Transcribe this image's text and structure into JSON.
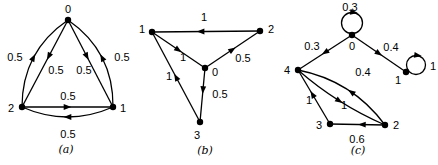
{
  "figure": {
    "background_color": "#ffffff",
    "ink_color": "#000000",
    "graphs": [
      {
        "id": "a",
        "caption": "(a)",
        "caption_pos": {
          "x": 66,
          "y": 149
        },
        "nodes": [
          {
            "id": "0",
            "x": 68,
            "y": 20,
            "lx": 68,
            "ly": 9
          },
          {
            "id": "2",
            "x": 22,
            "y": 107,
            "lx": 11,
            "ly": 108
          },
          {
            "id": "1",
            "x": 113,
            "y": 107,
            "lx": 123,
            "ly": 108
          }
        ],
        "edges": [
          {
            "from": "2",
            "to": "0",
            "weight": "0.5",
            "bend": -26,
            "t": 0.5,
            "label": {
              "x": 15,
              "y": 57
            }
          },
          {
            "from": "0",
            "to": "2",
            "weight": "0.5",
            "bend": 0,
            "t": 0.42,
            "label": {
              "x": 56,
              "y": 70
            }
          },
          {
            "from": "1",
            "to": "0",
            "weight": "0.5",
            "bend": 26,
            "t": 0.5,
            "label": {
              "x": 122,
              "y": 57
            }
          },
          {
            "from": "0",
            "to": "1",
            "weight": "0.5",
            "bend": 0,
            "t": 0.42,
            "label": {
              "x": 84,
              "y": 70
            }
          },
          {
            "from": "2",
            "to": "1",
            "weight": "0.5",
            "bend": 0,
            "t": 0.5,
            "label": {
              "x": 68,
              "y": 96
            }
          },
          {
            "from": "1",
            "to": "2",
            "weight": "0.5",
            "bend": -20,
            "t": 0.5,
            "label": {
              "x": 68,
              "y": 134
            }
          }
        ],
        "loops": []
      },
      {
        "id": "b",
        "caption": "(b)",
        "caption_pos": {
          "x": 205,
          "y": 150
        },
        "nodes": [
          {
            "id": "1",
            "x": 152,
            "y": 32,
            "lx": 142,
            "ly": 29
          },
          {
            "id": "2",
            "x": 260,
            "y": 31,
            "lx": 271,
            "ly": 29
          },
          {
            "id": "0",
            "x": 205,
            "y": 68,
            "lx": 215,
            "ly": 72
          },
          {
            "id": "3",
            "x": 200,
            "y": 122,
            "lx": 197,
            "ly": 135
          }
        ],
        "edges": [
          {
            "from": "2",
            "to": "1",
            "weight": "1",
            "bend": 0,
            "t": 0.55,
            "label": {
              "x": 204,
              "y": 17
            }
          },
          {
            "from": "1",
            "to": "0",
            "weight": "1",
            "bend": 0,
            "t": 0.5,
            "label": {
              "x": 183,
              "y": 57
            }
          },
          {
            "from": "0",
            "to": "2",
            "weight": "0.5",
            "bend": 0,
            "t": 0.5,
            "label": {
              "x": 243,
              "y": 58
            }
          },
          {
            "from": "0",
            "to": "3",
            "weight": "0.5",
            "bend": 0,
            "t": 0.41,
            "label": {
              "x": 220,
              "y": 94
            }
          },
          {
            "from": "3",
            "to": "1",
            "weight": "1",
            "bend": 0,
            "t": 0.5,
            "label": {
              "x": 169,
              "y": 76
            }
          }
        ],
        "loops": []
      },
      {
        "id": "c",
        "caption": "(c)",
        "caption_pos": {
          "x": 358,
          "y": 150
        },
        "nodes": [
          {
            "id": "0",
            "x": 352,
            "y": 35,
            "lx": 352,
            "ly": 46
          },
          {
            "id": "4",
            "x": 298,
            "y": 70,
            "lx": 287,
            "ly": 70
          },
          {
            "id": "1",
            "x": 406,
            "y": 72,
            "lx": 398,
            "ly": 80
          },
          {
            "id": "3",
            "x": 330,
            "y": 124,
            "lx": 319,
            "ly": 125
          },
          {
            "id": "2",
            "x": 385,
            "y": 125,
            "lx": 396,
            "ly": 125
          }
        ],
        "edges": [
          {
            "from": "0",
            "to": "4",
            "weight": "0.3",
            "bend": 0,
            "t": 0.5,
            "label": {
              "x": 312,
              "y": 46
            }
          },
          {
            "from": "0",
            "to": "1",
            "weight": "0.4",
            "bend": 0,
            "t": 0.5,
            "label": {
              "x": 391,
              "y": 47
            }
          },
          {
            "from": "2",
            "to": "4",
            "weight": "0.4",
            "bend": 20,
            "t": 0.45,
            "label": {
              "x": 363,
              "y": 72
            }
          },
          {
            "from": "4",
            "to": "2",
            "weight": "1",
            "bend": 8,
            "t": 0.5,
            "label": {
              "x": 344,
              "y": 105
            }
          },
          {
            "from": "3",
            "to": "4",
            "weight": "1",
            "bend": 0,
            "t": 0.55,
            "label": {
              "x": 309,
              "y": 100
            }
          },
          {
            "from": "2",
            "to": "3",
            "weight": "0.6",
            "bend": 0,
            "t": 0.42,
            "label": {
              "x": 357,
              "y": 139
            }
          }
        ],
        "loops": [
          {
            "node": "0",
            "cx": 352,
            "cy": 23,
            "r": 10.5,
            "weight": "0.3",
            "label": {
              "x": 350,
              "y": 7
            }
          },
          {
            "node": "1",
            "cx": 416,
            "cy": 65,
            "r": 9.5,
            "weight": "1",
            "label": {
              "x": 433,
              "y": 66
            }
          }
        ]
      }
    ]
  }
}
